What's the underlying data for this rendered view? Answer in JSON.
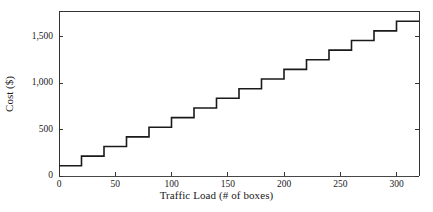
{
  "chart_data": {
    "type": "line",
    "subtype": "step",
    "title": "",
    "xlabel": "Traffic Load (# of boxes)",
    "ylabel": "Cost ($)",
    "xlim": [
      0,
      320
    ],
    "ylim": [
      0,
      1780
    ],
    "grid": false,
    "legend": null,
    "xticks": [
      0,
      50,
      100,
      150,
      200,
      250,
      300
    ],
    "xtick_labels": [
      "0",
      "50",
      "100",
      "150",
      "200",
      "250",
      "300"
    ],
    "yticks": [
      0,
      500,
      1000,
      1500
    ],
    "ytick_labels": [
      "0",
      "500",
      "1,000",
      "1,500"
    ],
    "series": [
      {
        "name": "Cost",
        "color": "#1a1a1a",
        "step_width": 20,
        "x": [
          0,
          20,
          40,
          60,
          80,
          100,
          120,
          140,
          160,
          180,
          200,
          220,
          240,
          260,
          280,
          300
        ],
        "values": [
          110,
          214,
          318,
          422,
          526,
          630,
          734,
          838,
          942,
          1046,
          1150,
          1254,
          1358,
          1462,
          1566,
          1670
        ]
      }
    ]
  },
  "axes": {
    "line_color": "#333333",
    "line_width": 1,
    "tick_length": 4,
    "frame_sides": [
      "left",
      "top",
      "right"
    ]
  }
}
